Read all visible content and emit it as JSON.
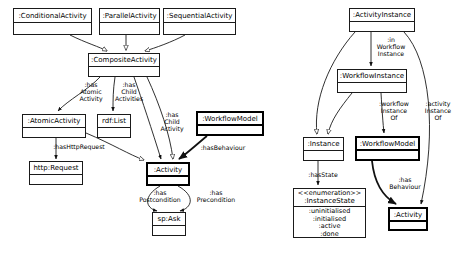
{
  "diagram": {
    "canvas": {
      "width": 470,
      "height": 253,
      "background": "#ffffff"
    },
    "stroke": "#1a1a1a",
    "thick_stroke": "#000000"
  },
  "classes": [
    {
      "id": "conditional-activity",
      "name": ":ConditionalActivity",
      "attrs": [],
      "thick": false,
      "x": 13,
      "y": 8,
      "w": 79,
      "h": 27,
      "name_h": 14
    },
    {
      "id": "parallel-activity",
      "name": ":ParallelActivity",
      "attrs": [],
      "thick": false,
      "x": 99,
      "y": 8,
      "w": 61,
      "h": 27,
      "name_h": 14
    },
    {
      "id": "sequential-activity",
      "name": ":SequentialActivity",
      "attrs": [],
      "thick": false,
      "x": 163,
      "y": 8,
      "w": 73,
      "h": 27,
      "name_h": 14
    },
    {
      "id": "composite-activity",
      "name": ":CompositeActivity",
      "attrs": [],
      "thick": false,
      "x": 88,
      "y": 53,
      "w": 72,
      "h": 24,
      "name_h": 13
    },
    {
      "id": "atomic-activity",
      "name": ":AtomicActivity",
      "attrs": [],
      "thick": false,
      "x": 22,
      "y": 114,
      "w": 64,
      "h": 24,
      "name_h": 13
    },
    {
      "id": "rdf-list",
      "name": "rdf:List",
      "attrs": [],
      "thick": false,
      "x": 97,
      "y": 114,
      "w": 34,
      "h": 24,
      "name_h": 13
    },
    {
      "id": "workflow-model-left",
      "name": ":WorkflowModel",
      "attrs": [],
      "thick": true,
      "x": 196,
      "y": 111,
      "w": 68,
      "h": 25,
      "name_h": 13
    },
    {
      "id": "http-request",
      "name": "http:Request",
      "attrs": [],
      "thick": false,
      "x": 29,
      "y": 161,
      "w": 54,
      "h": 24,
      "name_h": 13
    },
    {
      "id": "activity-left",
      "name": ":Activity",
      "attrs": [],
      "thick": true,
      "x": 146,
      "y": 162,
      "w": 44,
      "h": 24,
      "name_h": 13
    },
    {
      "id": "sp-ask",
      "name": "sp:Ask",
      "attrs": [],
      "thick": false,
      "x": 152,
      "y": 212,
      "w": 34,
      "h": 24,
      "name_h": 13
    },
    {
      "id": "activity-instance",
      "name": ":ActivityInstance",
      "attrs": [],
      "thick": false,
      "x": 349,
      "y": 8,
      "w": 66,
      "h": 24,
      "name_h": 13
    },
    {
      "id": "workflow-instance",
      "name": ":WorkflowInstance",
      "attrs": [],
      "thick": false,
      "x": 337,
      "y": 69,
      "w": 70,
      "h": 24,
      "name_h": 13
    },
    {
      "id": "instance",
      "name": ":Instance",
      "attrs": [],
      "thick": false,
      "x": 303,
      "y": 137,
      "w": 41,
      "h": 24,
      "name_h": 13
    },
    {
      "id": "workflow-model-right",
      "name": ":WorkflowModel",
      "attrs": [],
      "thick": true,
      "x": 355,
      "y": 136,
      "w": 65,
      "h": 25,
      "name_h": 13
    },
    {
      "id": "activity-right",
      "name": ":Activity",
      "attrs": [],
      "thick": true,
      "x": 388,
      "y": 207,
      "w": 40,
      "h": 24,
      "name_h": 13
    }
  ],
  "enumeration": {
    "id": "instance-state",
    "stereotype": "<<enumeration>>",
    "name": ":InstanceState",
    "values": [
      ":uninitialised",
      ":initialised",
      ":active",
      ":done"
    ],
    "x": 293,
    "y": 188,
    "w": 73,
    "h": 50,
    "name_h": 18
  },
  "edge_labels": [
    {
      "id": "has-atomic-activity",
      "text": ":has\nAtomic\nActivity",
      "x": 74,
      "y": 82,
      "w": 34
    },
    {
      "id": "has-child-activities",
      "text": ":has\nChild\nActivities",
      "x": 110,
      "y": 82,
      "w": 38
    },
    {
      "id": "has-child-activity",
      "text": ":has\nChild\nActivity",
      "x": 155,
      "y": 112,
      "w": 34
    },
    {
      "id": "has-http-request",
      "text": ":hasHttpRequest",
      "x": 48,
      "y": 144,
      "w": 62
    },
    {
      "id": "has-behaviour-left",
      "text": ":hasBehaviour",
      "x": 196,
      "y": 145,
      "w": 54
    },
    {
      "id": "has-postcondition",
      "text": ":has\nPostcondition",
      "x": 133,
      "y": 190,
      "w": 54
    },
    {
      "id": "has-precondition",
      "text": ":has\nPrecondition",
      "x": 190,
      "y": 190,
      "w": 52
    },
    {
      "id": "in-workflow-instance",
      "text": ":in\nWorkflow\nInstance",
      "x": 371,
      "y": 37,
      "w": 40
    },
    {
      "id": "workflow-instance-of",
      "text": ":workflow\nInstance\nOf",
      "x": 375,
      "y": 101,
      "w": 38
    },
    {
      "id": "activity-instance-of",
      "text": ":activity\nInstance\nOf",
      "x": 420,
      "y": 101,
      "w": 36
    },
    {
      "id": "has-state",
      "text": ":hasState",
      "x": 303,
      "y": 172,
      "w": 40
    },
    {
      "id": "has-behaviour-right",
      "text": ":has\nBehaviour",
      "x": 385,
      "y": 177,
      "w": 40
    }
  ],
  "edges": [
    {
      "id": "conditional-to-composite",
      "from": "conditional-activity",
      "to": "composite-activity",
      "marker": "hollow-triangle"
    },
    {
      "id": "parallel-to-composite",
      "from": "parallel-activity",
      "to": "composite-activity",
      "marker": "hollow-triangle"
    },
    {
      "id": "sequential-to-composite",
      "from": "sequential-activity",
      "to": "composite-activity",
      "marker": "hollow-triangle"
    },
    {
      "id": "composite-to-atomic",
      "from": "composite-activity",
      "to": "atomic-activity",
      "marker": "filled-arrow"
    },
    {
      "id": "composite-to-rdflist",
      "from": "composite-activity",
      "to": "rdf-list",
      "marker": "filled-arrow"
    },
    {
      "id": "composite-to-activity",
      "from": "composite-activity",
      "to": "activity-left",
      "marker": "filled-arrow"
    },
    {
      "id": "atomic-to-http",
      "from": "atomic-activity",
      "to": "http-request",
      "marker": "filled-arrow"
    },
    {
      "id": "atomic-to-activity-gen",
      "from": "atomic-activity",
      "to": "activity-left",
      "marker": "hollow-triangle"
    },
    {
      "id": "composite-to-activity-gen",
      "from": "composite-activity",
      "to": "activity-left",
      "marker": "hollow-triangle"
    },
    {
      "id": "workflowmodel-to-activity",
      "from": "workflow-model-left",
      "to": "activity-left",
      "marker": "filled-arrow"
    },
    {
      "id": "activity-to-spask-post",
      "from": "activity-left",
      "to": "sp-ask",
      "marker": "filled-arrow"
    },
    {
      "id": "activity-to-spask-pre",
      "from": "activity-left",
      "to": "sp-ask",
      "marker": "filled-arrow"
    },
    {
      "id": "activityinstance-to-workflowinstance",
      "from": "activity-instance",
      "to": "workflow-instance",
      "marker": "filled-arrow"
    },
    {
      "id": "activityinstance-to-instance-gen",
      "from": "activity-instance",
      "to": "instance",
      "marker": "hollow-triangle"
    },
    {
      "id": "workflowinstance-to-instance-gen",
      "from": "workflow-instance",
      "to": "instance",
      "marker": "hollow-triangle"
    },
    {
      "id": "workflowinstance-to-workflowmodel",
      "from": "workflow-instance",
      "to": "workflow-model-right",
      "marker": "filled-arrow"
    },
    {
      "id": "activityinstance-to-activity",
      "from": "activity-instance",
      "to": "activity-right",
      "marker": "filled-arrow"
    },
    {
      "id": "instance-to-instancestate",
      "from": "instance",
      "to": "instance-state",
      "marker": "filled-arrow"
    },
    {
      "id": "workflowmodel-to-activity-right",
      "from": "workflow-model-right",
      "to": "activity-right",
      "marker": "filled-arrow"
    }
  ]
}
